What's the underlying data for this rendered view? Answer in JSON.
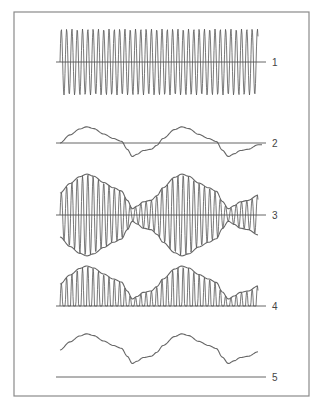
{
  "diagram": {
    "title": "",
    "frame": {
      "x": 14,
      "y": 12,
      "width": 295,
      "height": 384,
      "stroke": "#8a8a8a"
    },
    "ink_color": "#555555",
    "x_start": 60,
    "x_end": 258,
    "panels": [
      {
        "id": 1,
        "label": "1",
        "kind": "carrier",
        "axis_y": 62,
        "amplitude": 33,
        "period": 5.3,
        "label_x": 272,
        "axis_x_end": 266
      },
      {
        "id": 2,
        "label": "2",
        "kind": "audio",
        "axis_y": 143,
        "amplitude": 1,
        "label_x": 272,
        "axis_x_end": 266
      },
      {
        "id": 3,
        "label": "3",
        "kind": "modulated",
        "axis_y": 215,
        "period": 5.3,
        "label_x": 272,
        "axis_x_end": 266
      },
      {
        "id": 4,
        "label": "4",
        "kind": "rectified",
        "axis_y": 306,
        "period": 5.3,
        "label_x": 272,
        "axis_x_end": 266
      },
      {
        "id": 5,
        "label": "5",
        "kind": "recovered",
        "axis_y": 377,
        "curve_base_y": 350,
        "label_x": 272,
        "axis_x_end": 266
      }
    ],
    "audio_signal": {
      "description": "two-cycle irregular audio waveform",
      "points": [
        [
          0.0,
          0.0
        ],
        [
          0.05,
          0.45
        ],
        [
          0.1,
          0.78
        ],
        [
          0.135,
          0.9
        ],
        [
          0.17,
          0.8
        ],
        [
          0.22,
          0.5
        ],
        [
          0.27,
          0.25
        ],
        [
          0.31,
          0.1
        ],
        [
          0.34,
          -0.35
        ],
        [
          0.365,
          -0.75
        ],
        [
          0.39,
          -0.62
        ],
        [
          0.42,
          -0.42
        ],
        [
          0.46,
          -0.35
        ],
        [
          0.49,
          -0.12
        ],
        [
          0.52,
          0.25
        ],
        [
          0.58,
          0.75
        ],
        [
          0.615,
          0.9
        ],
        [
          0.65,
          0.8
        ],
        [
          0.7,
          0.48
        ],
        [
          0.75,
          0.25
        ],
        [
          0.79,
          0.08
        ],
        [
          0.82,
          -0.4
        ],
        [
          0.85,
          -0.75
        ],
        [
          0.88,
          -0.6
        ],
        [
          0.91,
          -0.42
        ],
        [
          0.95,
          -0.35
        ],
        [
          1.0,
          -0.1
        ]
      ]
    }
  }
}
